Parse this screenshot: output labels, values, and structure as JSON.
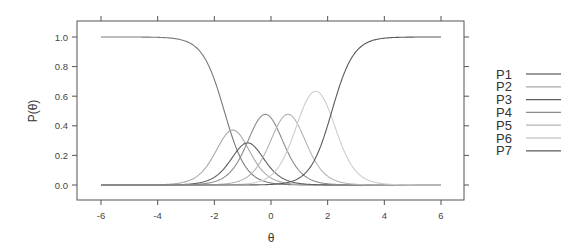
{
  "chart_data": {
    "type": "line",
    "title": "",
    "xlabel": "θ",
    "ylabel": "P(θ)",
    "xlim": [
      -6.85,
      6.85
    ],
    "ylim": [
      -0.1,
      1.1
    ],
    "xticks": [
      -6,
      -4,
      -2,
      0,
      2,
      4,
      6
    ],
    "xtick_labels": [
      "-6",
      "-4",
      "-2",
      "0",
      "2",
      "4",
      "6"
    ],
    "yticks": [
      0.0,
      0.2,
      0.4,
      0.6,
      0.8,
      1.0
    ],
    "ytick_labels": [
      "0.0",
      "0.2",
      "0.4",
      "0.6",
      "0.8",
      "1.0"
    ],
    "grid": false,
    "legend_position": "right",
    "x_range_plotted": [
      -6,
      6
    ],
    "model": {
      "kind": "graded_response_category_curves",
      "discrimination": 2.6,
      "thresholds": [
        -1.65,
        -1.05,
        -0.6,
        0.2,
        1.0,
        2.15
      ]
    },
    "series": [
      {
        "name": "P1",
        "color": "#7a7a7a",
        "shape": "decreasing",
        "value_at_minus6": 1.0,
        "crosses_half_at": -1.65
      },
      {
        "name": "P2",
        "color": "#a8a8a8",
        "shape": "peak",
        "peak_theta": -1.35,
        "peak_value": 0.34
      },
      {
        "name": "P3",
        "color": "#5e5e5e",
        "shape": "peak",
        "peak_theta": -0.85,
        "peak_value": 0.37
      },
      {
        "name": "P4",
        "color": "#8c8c8c",
        "shape": "peak",
        "peak_theta": -0.2,
        "peak_value": 0.6
      },
      {
        "name": "P5",
        "color": "#b4b4b4",
        "shape": "peak",
        "peak_theta": 0.6,
        "peak_value": 0.55
      },
      {
        "name": "P6",
        "color": "#cdcdcd",
        "shape": "peak",
        "peak_theta": 1.45,
        "peak_value": 0.66
      },
      {
        "name": "P7",
        "color": "#5a5a5a",
        "shape": "increasing",
        "value_at_6": 1.0,
        "crosses_half_at": 2.15
      }
    ]
  }
}
